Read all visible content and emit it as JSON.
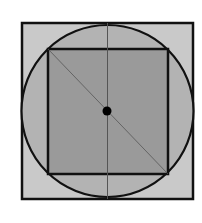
{
  "diagram": {
    "colors": {
      "background": "#ffffff",
      "outer_square_fill": "#c9c9c9",
      "circle_fill": "#b3b3b3",
      "inner_square_fill": "#9a9a9a",
      "stroke": "#111111",
      "thin_line": "#555555",
      "center_dot": "#000000"
    },
    "outer_square": {
      "x": 22,
      "y": 23,
      "width": 171,
      "height": 176
    },
    "circle": {
      "cx": 107.5,
      "cy": 111,
      "r": 86
    },
    "inner_square": {
      "x": 48,
      "y": 49,
      "width": 120,
      "height": 125
    },
    "vertical_line": {
      "x": 107.5,
      "y1": 23,
      "y2": 199
    },
    "diagonal": {
      "x1": 48,
      "y1": 49,
      "x2": 168,
      "y2": 174
    },
    "center_point": {
      "cx": 107,
      "cy": 111,
      "r": 4.5
    }
  }
}
